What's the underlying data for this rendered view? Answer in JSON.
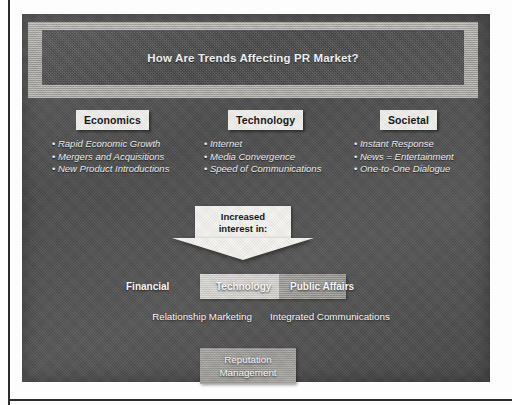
{
  "slide": {
    "header": {
      "title": "How Are Trends Affecting PR Market?"
    },
    "trend_columns": [
      {
        "heading": "Economics",
        "bullets": [
          "Rapid Economic Growth",
          "Mergers and Acquisitions",
          "New Product Introductions"
        ]
      },
      {
        "heading": "Technology",
        "bullets": [
          "Internet",
          "Media Convergence",
          "Speed of Communications"
        ]
      },
      {
        "heading": "Societal",
        "bullets": [
          "Instant Response",
          "News = Entertainment",
          "One-to-One Dialogue"
        ]
      }
    ],
    "arrow": {
      "line1": "Increased",
      "line2": "interest in:"
    },
    "outcomes": {
      "row1": [
        "Financial",
        "Technology",
        "Public Affairs"
      ],
      "row2": [
        "Relationship Marketing",
        "Integrated Communications"
      ],
      "row3": [
        "Reputation Management"
      ]
    },
    "colors": {
      "panel_background": "#4f4f4f",
      "header_frame": "#b0aeaa",
      "header_inner": "#505050",
      "label_box": "#f2f1ee",
      "highlight_band": "#d6d5d1",
      "highlight_band_dim": "#9a9894",
      "reputation_box": "#a09e9a",
      "text_light": "#ffffff",
      "text_dark": "#111111",
      "scan_edge": "#2b2b2b"
    }
  }
}
